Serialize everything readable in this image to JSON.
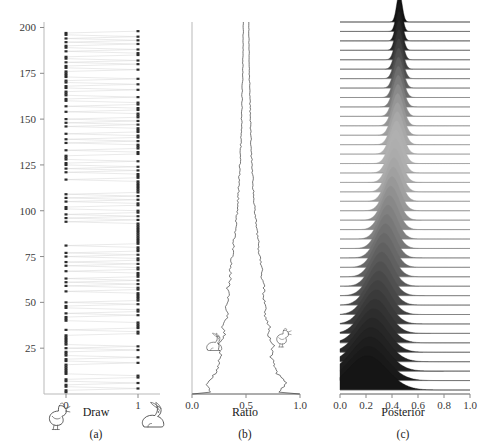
{
  "figure": {
    "width": 485,
    "height": 448,
    "background": "#ffffff"
  },
  "chart_data": [
    {
      "type": "scatter",
      "panel": "a",
      "panel_label": "(a)",
      "title": "",
      "xlabel": "Draw",
      "ylabel": "",
      "xlim": [
        -0.35,
        1.35
      ],
      "ylim": [
        0,
        203
      ],
      "xticks": [
        0,
        1
      ],
      "xticklabels": [
        "0",
        "1"
      ],
      "yticks": [
        25,
        50,
        75,
        100,
        125,
        150,
        175,
        200
      ],
      "yticklabels": [
        "25",
        "50",
        "75",
        "100",
        "125",
        "150",
        "175",
        "200"
      ],
      "grid": false,
      "legend": "none",
      "marker_color": "#2b2b2b",
      "link_color": "#d8d8d8",
      "icons": [
        {
          "name": "chicken-icon",
          "side": "left",
          "x_value": 0,
          "meaning": "draw value 0"
        },
        {
          "name": "rabbit-icon",
          "side": "right",
          "x_value": 1,
          "meaning": "draw value 1"
        }
      ],
      "description": "Binary draws (0 = chicken, 1 = rabbit) for iterations 1..200, consecutive draws joined by faint lines.",
      "draws": [
        0,
        0,
        1,
        0,
        0,
        1,
        0,
        0,
        1,
        1,
        0,
        0,
        0,
        0,
        0,
        0,
        1,
        0,
        0,
        1,
        0,
        0,
        0,
        1,
        0,
        1,
        0,
        0,
        0,
        0,
        0,
        0,
        1,
        1,
        0,
        1,
        1,
        1,
        1,
        0,
        0,
        0,
        1,
        0,
        1,
        1,
        0,
        0,
        1,
        0,
        1,
        1,
        1,
        1,
        1,
        0,
        1,
        1,
        0,
        1,
        0,
        1,
        0,
        1,
        1,
        1,
        0,
        1,
        1,
        0,
        1,
        0,
        1,
        1,
        0,
        1,
        0,
        1,
        1,
        1,
        0,
        1,
        1,
        1,
        1,
        1,
        1,
        1,
        1,
        1,
        1,
        1,
        1,
        0,
        1,
        0,
        1,
        0,
        1,
        1,
        0,
        0,
        1,
        1,
        0,
        1,
        0,
        1,
        0,
        1,
        1,
        1,
        1,
        1,
        1,
        1,
        0,
        1,
        1,
        1,
        0,
        1,
        0,
        1,
        0,
        0,
        1,
        0,
        0,
        0,
        1,
        1,
        0,
        1,
        1,
        1,
        0,
        1,
        0,
        1,
        1,
        0,
        1,
        1,
        1,
        0,
        1,
        0,
        1,
        0,
        1,
        1,
        1,
        0,
        1,
        1,
        0,
        1,
        1,
        0,
        0,
        1,
        0,
        0,
        0,
        1,
        0,
        0,
        1,
        0,
        0,
        1,
        0,
        0,
        0,
        0,
        1,
        0,
        0,
        1,
        0,
        1,
        0,
        0,
        1,
        1,
        0,
        1,
        0,
        0,
        1,
        0,
        1,
        0,
        1,
        0,
        0,
        1
      ]
    },
    {
      "type": "area",
      "panel": "b",
      "panel_label": "(b)",
      "title": "",
      "xlabel": "Ratio",
      "ylabel": "",
      "xlim": [
        0.0,
        1.0
      ],
      "ylim": [
        0,
        203
      ],
      "xticks": [
        0.0,
        0.5,
        1.0
      ],
      "xticklabels": [
        "0.0",
        "0.5",
        "1.0"
      ],
      "grid": false,
      "legend": "none",
      "curve_color": "#4a4a4a",
      "icons": [
        {
          "name": "rabbit-icon",
          "side": "left",
          "approx_x": 0.26,
          "approx_y": 42
        },
        {
          "name": "chicken-icon",
          "side": "right",
          "approx_x": 0.74,
          "approx_y": 48
        }
      ],
      "description": "Running ratio of rabbit draws with shrinking uncertainty band; two boundary curves converge from wide at the bottom (iteration 1) to a narrow band at 0.5 at the top (iteration 200).",
      "series": [
        {
          "name": "lower_bound",
          "x_at_iteration": [
            0.18,
            0.13,
            0.22,
            0.25,
            0.27,
            0.24,
            0.3,
            0.28,
            0.33,
            0.32,
            0.34,
            0.33,
            0.36,
            0.35,
            0.37,
            0.38,
            0.39,
            0.4,
            0.41,
            0.42,
            0.425,
            0.43,
            0.435,
            0.44,
            0.445,
            0.45,
            0.452,
            0.455,
            0.458,
            0.46,
            0.462,
            0.464,
            0.466,
            0.468,
            0.47,
            0.471,
            0.472,
            0.473,
            0.474,
            0.475
          ]
        },
        {
          "name": "upper_bound",
          "x_at_iteration": [
            0.82,
            0.87,
            0.78,
            0.75,
            0.73,
            0.76,
            0.7,
            0.72,
            0.67,
            0.68,
            0.66,
            0.67,
            0.64,
            0.65,
            0.63,
            0.62,
            0.61,
            0.6,
            0.59,
            0.58,
            0.575,
            0.57,
            0.565,
            0.56,
            0.555,
            0.55,
            0.548,
            0.545,
            0.542,
            0.54,
            0.538,
            0.536,
            0.534,
            0.532,
            0.53,
            0.529,
            0.528,
            0.527,
            0.526,
            0.525
          ]
        }
      ]
    },
    {
      "type": "area",
      "panel": "c",
      "panel_label": "(c)",
      "title": "",
      "xlabel": "Posterior",
      "ylabel": "",
      "xlim": [
        0.0,
        1.0
      ],
      "ylim": [
        0,
        203
      ],
      "xticks": [
        0.0,
        0.2,
        0.4,
        0.6,
        0.8,
        1.0
      ],
      "xticklabels": [
        "0.0",
        "0.2",
        "0.4",
        "0.6",
        "0.8",
        "1.0"
      ],
      "grid": false,
      "legend": "none",
      "style": "ridgeline",
      "n_ridges": 40,
      "description": "Ridgeline (joyplot) of sequentially updated Beta posterior densities; bottom rows are wide and dark (few observations, peak near 0.2), top rows are narrow and light-to-dark peaked near 0.45.",
      "ridges": [
        {
          "index": 1,
          "peak": 0.21,
          "sd": 0.15,
          "fill": "#151515"
        },
        {
          "index": 2,
          "peak": 0.22,
          "sd": 0.14,
          "fill": "#191919"
        },
        {
          "index": 3,
          "peak": 0.23,
          "sd": 0.132,
          "fill": "#1d1d1d"
        },
        {
          "index": 4,
          "peak": 0.24,
          "sd": 0.124,
          "fill": "#222222"
        },
        {
          "index": 5,
          "peak": 0.25,
          "sd": 0.117,
          "fill": "#272727"
        },
        {
          "index": 6,
          "peak": 0.26,
          "sd": 0.111,
          "fill": "#2d2d2d"
        },
        {
          "index": 7,
          "peak": 0.27,
          "sd": 0.105,
          "fill": "#333333"
        },
        {
          "index": 8,
          "peak": 0.28,
          "sd": 0.1,
          "fill": "#3a3a3a"
        },
        {
          "index": 9,
          "peak": 0.29,
          "sd": 0.095,
          "fill": "#414141"
        },
        {
          "index": 10,
          "peak": 0.3,
          "sd": 0.091,
          "fill": "#484848"
        },
        {
          "index": 11,
          "peak": 0.31,
          "sd": 0.087,
          "fill": "#505050"
        },
        {
          "index": 12,
          "peak": 0.32,
          "sd": 0.083,
          "fill": "#585858"
        },
        {
          "index": 13,
          "peak": 0.33,
          "sd": 0.08,
          "fill": "#606060"
        },
        {
          "index": 14,
          "peak": 0.34,
          "sd": 0.077,
          "fill": "#686868"
        },
        {
          "index": 15,
          "peak": 0.35,
          "sd": 0.074,
          "fill": "#707070"
        },
        {
          "index": 16,
          "peak": 0.36,
          "sd": 0.071,
          "fill": "#787878"
        },
        {
          "index": 17,
          "peak": 0.37,
          "sd": 0.068,
          "fill": "#808080"
        },
        {
          "index": 18,
          "peak": 0.38,
          "sd": 0.066,
          "fill": "#888888"
        },
        {
          "index": 19,
          "peak": 0.39,
          "sd": 0.063,
          "fill": "#909090"
        },
        {
          "index": 20,
          "peak": 0.4,
          "sd": 0.061,
          "fill": "#989898"
        },
        {
          "index": 21,
          "peak": 0.41,
          "sd": 0.059,
          "fill": "#a0a0a0"
        },
        {
          "index": 22,
          "peak": 0.415,
          "sd": 0.057,
          "fill": "#a6a6a6"
        },
        {
          "index": 23,
          "peak": 0.42,
          "sd": 0.055,
          "fill": "#ababab"
        },
        {
          "index": 24,
          "peak": 0.425,
          "sd": 0.053,
          "fill": "#aeaeae"
        },
        {
          "index": 25,
          "peak": 0.43,
          "sd": 0.051,
          "fill": "#b0b0b0"
        },
        {
          "index": 26,
          "peak": 0.435,
          "sd": 0.049,
          "fill": "#aeaeae"
        },
        {
          "index": 27,
          "peak": 0.44,
          "sd": 0.047,
          "fill": "#a8a8a8"
        },
        {
          "index": 28,
          "peak": 0.442,
          "sd": 0.045,
          "fill": "#a0a0a0"
        },
        {
          "index": 29,
          "peak": 0.444,
          "sd": 0.043,
          "fill": "#969696"
        },
        {
          "index": 30,
          "peak": 0.446,
          "sd": 0.041,
          "fill": "#8a8a8a"
        },
        {
          "index": 31,
          "peak": 0.448,
          "sd": 0.039,
          "fill": "#7c7c7c"
        },
        {
          "index": 32,
          "peak": 0.449,
          "sd": 0.037,
          "fill": "#6d6d6d"
        },
        {
          "index": 33,
          "peak": 0.45,
          "sd": 0.035,
          "fill": "#5e5e5e"
        },
        {
          "index": 34,
          "peak": 0.451,
          "sd": 0.033,
          "fill": "#4f4f4f"
        },
        {
          "index": 35,
          "peak": 0.452,
          "sd": 0.031,
          "fill": "#414141"
        },
        {
          "index": 36,
          "peak": 0.453,
          "sd": 0.029,
          "fill": "#343434"
        },
        {
          "index": 37,
          "peak": 0.454,
          "sd": 0.027,
          "fill": "#282828"
        },
        {
          "index": 38,
          "peak": 0.455,
          "sd": 0.025,
          "fill": "#1e1e1e"
        },
        {
          "index": 39,
          "peak": 0.456,
          "sd": 0.023,
          "fill": "#161616"
        },
        {
          "index": 40,
          "peak": 0.457,
          "sd": 0.021,
          "fill": "#101010"
        }
      ]
    }
  ]
}
